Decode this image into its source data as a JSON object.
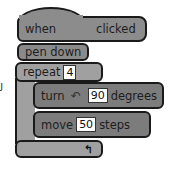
{
  "script": {
    "hat_block": {
      "prefix": "when",
      "suffix": "clicked"
    },
    "pen_block": {
      "label": "pen down"
    },
    "repeat_block": {
      "label": "repeat",
      "count": "4",
      "loop_icon": "↰"
    },
    "turn_block": {
      "label": "turn",
      "icon": "↶",
      "value": "90",
      "unit": "degrees"
    },
    "move_block": {
      "label": "move",
      "value": "50",
      "unit": "steps"
    }
  },
  "stray_glyph": "ﻟ",
  "colors": {
    "hat": "#8c8c8c",
    "pen": "#8a8a8a",
    "repeat": "#a0a0a0",
    "motion": "#7c7c7c",
    "outline": "#1a1a1a"
  }
}
